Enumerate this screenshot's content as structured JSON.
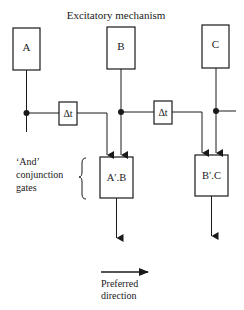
{
  "title": "Excitatory mechanism",
  "receptors": [
    {
      "id": "A",
      "label": "A"
    },
    {
      "id": "B",
      "label": "B"
    },
    {
      "id": "C",
      "label": "C"
    }
  ],
  "delays": [
    {
      "label": "Δt"
    },
    {
      "label": "Δt"
    }
  ],
  "gates": [
    {
      "label": "A′.B"
    },
    {
      "label": "B′.C"
    }
  ],
  "gates_annotation": {
    "line1": "‘And’",
    "line2": "conjunction",
    "line3": "gates"
  },
  "preferred": {
    "line1": "Preferred",
    "line2": "direction"
  },
  "colors": {
    "ink": "#1a1a1a",
    "background": "#ffffff"
  }
}
